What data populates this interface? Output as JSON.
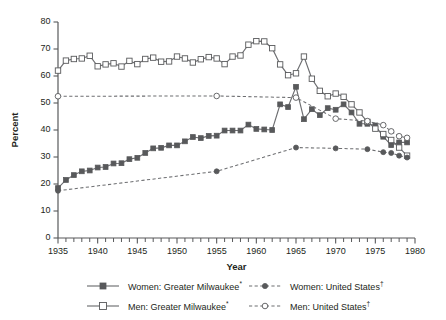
{
  "chart_data": {
    "type": "line",
    "title": "",
    "xlabel": "Year",
    "ylabel": "Percent",
    "xlim": [
      1935,
      1980
    ],
    "ylim": [
      0,
      80
    ],
    "ytick_labels": [
      "0",
      "10",
      "20",
      "30",
      "40",
      "50",
      "60",
      "70",
      "80"
    ],
    "ytick_values": [
      0,
      10,
      20,
      30,
      40,
      50,
      60,
      70,
      80
    ],
    "xtick_labels": [
      "1935",
      "1940",
      "1945",
      "1950",
      "1955",
      "1960",
      "1965",
      "1970",
      "1975",
      "1980"
    ],
    "xtick_values": [
      1935,
      1940,
      1945,
      1950,
      1955,
      1960,
      1965,
      1970,
      1975,
      1980
    ],
    "x_minor_step": 1,
    "grid": false,
    "legend_position": "below",
    "series": [
      {
        "name": "Women: Greater Milwaukee*",
        "marker": "filled-square",
        "line": "solid",
        "color": "#58595b",
        "x": [
          1935,
          1936,
          1937,
          1938,
          1939,
          1940,
          1941,
          1942,
          1943,
          1944,
          1945,
          1946,
          1947,
          1948,
          1949,
          1950,
          1951,
          1952,
          1953,
          1954,
          1955,
          1956,
          1957,
          1958,
          1959,
          1960,
          1961,
          1962,
          1963,
          1964,
          1965,
          1966,
          1967,
          1968,
          1969,
          1970,
          1971,
          1972,
          1973,
          1974,
          1975,
          1976,
          1977,
          1978,
          1979
        ],
        "y": [
          18.5,
          21.5,
          23.3,
          24.7,
          25.0,
          26.1,
          26.3,
          27.6,
          27.7,
          29.2,
          29.7,
          31.5,
          33.2,
          33.4,
          34.3,
          34.3,
          35.8,
          37.4,
          37.0,
          37.8,
          37.9,
          39.8,
          39.8,
          39.8,
          42.0,
          40.4,
          40.2,
          40.0,
          49.5,
          48.5,
          56.0,
          44.0,
          47.7,
          45.5,
          48.1,
          47.5,
          49.5,
          46.5,
          42.3,
          42.3,
          41.7,
          37.5,
          34.4,
          35.4,
          35.4
        ]
      },
      {
        "name": "Men: Greater Milwaukee*",
        "marker": "open-square",
        "line": "solid",
        "color": "#58595b",
        "x": [
          1935,
          1936,
          1937,
          1938,
          1939,
          1940,
          1941,
          1942,
          1943,
          1944,
          1945,
          1946,
          1947,
          1948,
          1949,
          1950,
          1951,
          1952,
          1953,
          1954,
          1955,
          1956,
          1957,
          1958,
          1959,
          1960,
          1961,
          1962,
          1963,
          1964,
          1965,
          1966,
          1967,
          1968,
          1969,
          1970,
          1971,
          1972,
          1973,
          1974,
          1975,
          1976,
          1977,
          1978,
          1979
        ],
        "y": [
          62.0,
          65.7,
          66.3,
          66.5,
          67.5,
          63.6,
          64.3,
          64.7,
          63.5,
          65.6,
          64.4,
          66.3,
          66.8,
          65.3,
          65.4,
          67.2,
          66.5,
          65.0,
          66.2,
          67.0,
          66.5,
          64.4,
          67.2,
          67.6,
          71.6,
          72.9,
          72.8,
          70.3,
          64.3,
          60.3,
          61.0,
          67.2,
          59.0,
          54.5,
          52.5,
          53.5,
          52.3,
          49.5,
          46.5,
          43.0,
          40.5,
          38.5,
          36.3,
          33.5,
          30.5
        ]
      },
      {
        "name": "Women: United States†",
        "marker": "filled-circle",
        "line": "dashed",
        "color": "#58595b",
        "x": [
          1935,
          1955,
          1965,
          1970,
          1974,
          1976,
          1977,
          1978,
          1979
        ],
        "y": [
          17.5,
          24.7,
          33.5,
          33.2,
          32.9,
          31.8,
          31.5,
          30.5,
          29.8
        ]
      },
      {
        "name": "Men: United States†",
        "marker": "open-circle",
        "line": "dashed",
        "color": "#58595b",
        "x": [
          1935,
          1955,
          1965,
          1970,
          1974,
          1976,
          1977,
          1978,
          1979
        ],
        "y": [
          52.5,
          52.6,
          52.0,
          44.2,
          43.3,
          41.8,
          39.5,
          37.7,
          37.1
        ]
      }
    ],
    "annotations": []
  },
  "axes": {
    "y_title": "Percent",
    "x_title": "Year"
  },
  "legend": {
    "items": [
      {
        "label": "Women: Greater Milwaukee",
        "suffix": "*",
        "key": "solid-filled-square"
      },
      {
        "label": "Men: Greater Milwaukee",
        "suffix": "*",
        "key": "solid-open-square"
      },
      {
        "label": "Women: United States",
        "suffix": "†",
        "key": "dashed-filled-circle"
      },
      {
        "label": "Men: United States",
        "suffix": "†",
        "key": "dashed-open-circle"
      }
    ]
  },
  "colors": {
    "line": "#6d6e71",
    "marker": "#58595b",
    "axis": "#58595b",
    "text": "#231f20",
    "background": "#ffffff"
  }
}
